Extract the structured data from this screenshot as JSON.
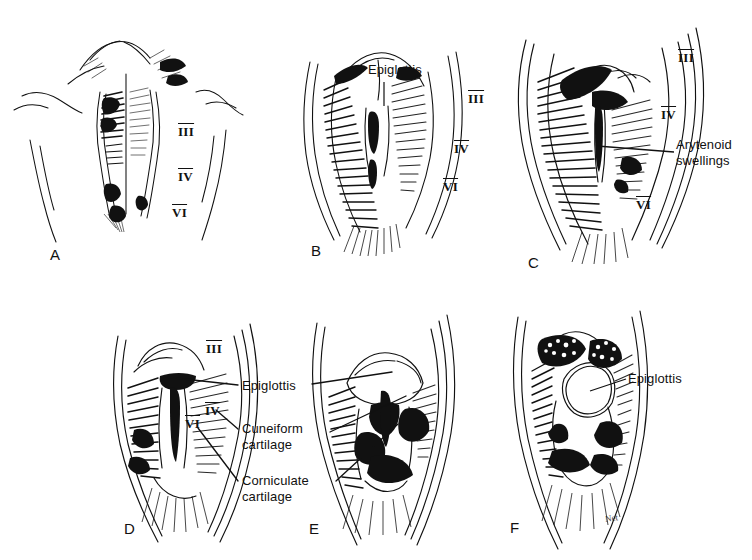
{
  "figure": {
    "type": "anatomical-illustration",
    "background_color": "#ffffff",
    "ink_color": "#111111",
    "panel_count": 6
  },
  "panels": [
    {
      "id": "A",
      "letter": "A",
      "numerals": [
        {
          "text": "III"
        },
        {
          "text": "IV"
        },
        {
          "text": "VI"
        }
      ],
      "labels": []
    },
    {
      "id": "B",
      "letter": "B",
      "numerals": [
        {
          "text": "III"
        },
        {
          "text": "IV"
        },
        {
          "text": "VI"
        }
      ],
      "labels": [
        {
          "text": "Epiglottis"
        }
      ]
    },
    {
      "id": "C",
      "letter": "C",
      "numerals": [
        {
          "text": "III"
        },
        {
          "text": "IV"
        },
        {
          "text": "VI"
        }
      ],
      "labels": [
        {
          "text": "Arytenoid\nswellings"
        }
      ]
    },
    {
      "id": "D",
      "letter": "D",
      "numerals": [
        {
          "text": "III"
        },
        {
          "text": "IV"
        },
        {
          "text": "VI"
        }
      ],
      "labels": [
        {
          "text": "Epiglottis"
        },
        {
          "text": "Cuneiform\ncartilage"
        },
        {
          "text": "Corniculate\ncartilage"
        }
      ]
    },
    {
      "id": "E",
      "letter": "E",
      "numerals": [],
      "labels": []
    },
    {
      "id": "F",
      "letter": "F",
      "numerals": [],
      "labels": [
        {
          "text": "Epiglottis"
        }
      ],
      "signature": "Net"
    }
  ],
  "shared_labels": {
    "epiglottis": "Epiglottis",
    "arytenoid_swellings": "Arytenoid\nswellings",
    "cuneiform_cartilage": "Cuneiform\ncartilage",
    "corniculate_cartilage": "Corniculate\ncartilage"
  }
}
